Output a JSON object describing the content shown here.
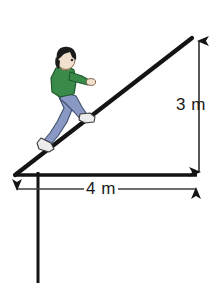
{
  "figure": {
    "type": "geometry-diagram",
    "background_color": "#ffffff",
    "line_color": "#141414"
  },
  "dimensions": {
    "height": {
      "label": "3 m",
      "value": 3,
      "unit": "m",
      "orientation": "vertical",
      "arrow_style": "double-headed"
    },
    "base": {
      "label": "4 m",
      "value": 4,
      "unit": "m",
      "orientation": "horizontal",
      "arrow_style": "double-headed"
    }
  },
  "shapes": {
    "ramp": {
      "name": "inclined-plane",
      "apex": {
        "x": 192,
        "y": 38
      },
      "left_vertex": {
        "x": 15,
        "y": 175
      },
      "right_vertex": {
        "x": 192,
        "y": 175
      }
    },
    "ground_line": {
      "x1": 15,
      "y1": 175,
      "x2": 197,
      "y2": 175
    },
    "post": {
      "x": 38,
      "y1": 175,
      "y2": 283
    }
  },
  "person": {
    "name": "person-climbing",
    "hair_color": "#1b1b1b",
    "skin_color": "#f2e0cf",
    "shirt_color": "#3a8a4a",
    "pants_color": "#8a99c4",
    "shoe_color": "#e8e8e8",
    "facing": "up-the-ramp"
  }
}
